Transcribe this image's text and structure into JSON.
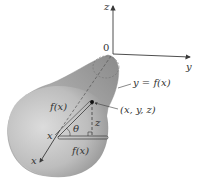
{
  "figure": {
    "type": "surface-of-revolution",
    "axes": {
      "x_label": "x",
      "y_label": "y",
      "z_label": "z",
      "origin_label": "0"
    },
    "labels": {
      "curve": "y = f(x)",
      "point": "(x, y, z)",
      "radius_upper": "f(x)",
      "radius_lower": "f(x)",
      "x_position": "x",
      "angle": "θ",
      "z_height": "z"
    },
    "colors": {
      "surface_light": "#d9d9d9",
      "surface_dark": "#8a8a8a",
      "axis": "#3a3a3a",
      "text": "#333333",
      "background": "#ffffff"
    }
  }
}
